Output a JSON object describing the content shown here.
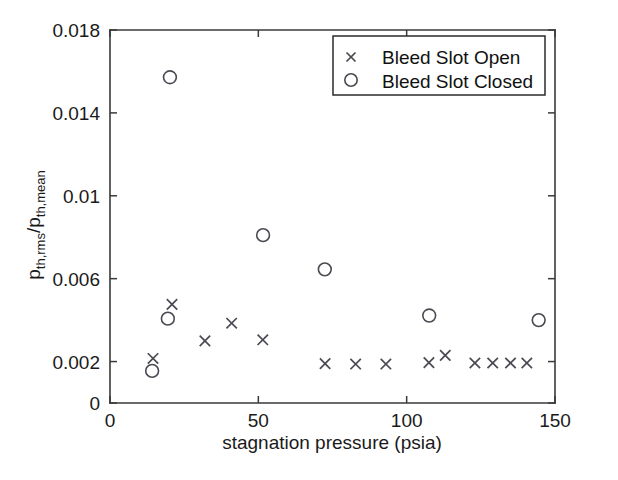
{
  "chart_data": {
    "type": "scatter",
    "title": "",
    "xlabel": "stagnation pressure (psia)",
    "ylabel": "p_th,rms / p_th,mean",
    "ylabel_parts": {
      "base1": "p",
      "sub1": "th,rms",
      "slash": "/p",
      "sub2": "th,mean"
    },
    "xlim": [
      0,
      150
    ],
    "ylim": [
      0,
      0.018
    ],
    "xticks": [
      0,
      50,
      100,
      150
    ],
    "xtick_labels": [
      "0",
      "50",
      "100",
      "150"
    ],
    "yticks": [
      0,
      0.002,
      0.006,
      0.01,
      0.014,
      0.018
    ],
    "ytick_labels": [
      "0",
      "0.002",
      "0.006",
      "0.01",
      "0.014",
      "0.018"
    ],
    "grid": false,
    "legend_position": "upper right",
    "series": [
      {
        "name": "Bleed Slot Open",
        "marker": "x",
        "color": "#4a4a52",
        "points": [
          {
            "x": 14.5,
            "y": 0.00215
          },
          {
            "x": 20.9,
            "y": 0.00476
          },
          {
            "x": 32.0,
            "y": 0.003
          },
          {
            "x": 41.0,
            "y": 0.00385
          },
          {
            "x": 51.5,
            "y": 0.00305
          },
          {
            "x": 72.5,
            "y": 0.0019
          },
          {
            "x": 82.8,
            "y": 0.00188
          },
          {
            "x": 93.0,
            "y": 0.00188
          },
          {
            "x": 107.5,
            "y": 0.00195
          },
          {
            "x": 113.0,
            "y": 0.0023
          },
          {
            "x": 123.0,
            "y": 0.00193
          },
          {
            "x": 129.0,
            "y": 0.00193
          },
          {
            "x": 135.0,
            "y": 0.00193
          },
          {
            "x": 140.5,
            "y": 0.00193
          }
        ]
      },
      {
        "name": "Bleed Slot Closed",
        "marker": "o",
        "color": "#4a4a52",
        "points": [
          {
            "x": 14.2,
            "y": 0.00155
          },
          {
            "x": 19.5,
            "y": 0.00407
          },
          {
            "x": 20.2,
            "y": 0.01572
          },
          {
            "x": 51.6,
            "y": 0.0081
          },
          {
            "x": 72.4,
            "y": 0.00645
          },
          {
            "x": 107.6,
            "y": 0.00422
          },
          {
            "x": 144.5,
            "y": 0.004
          }
        ]
      }
    ]
  },
  "legend": {
    "entries": [
      {
        "marker": "x",
        "label": "Bleed Slot Open"
      },
      {
        "marker": "o",
        "label": "Bleed Slot Closed"
      }
    ]
  }
}
